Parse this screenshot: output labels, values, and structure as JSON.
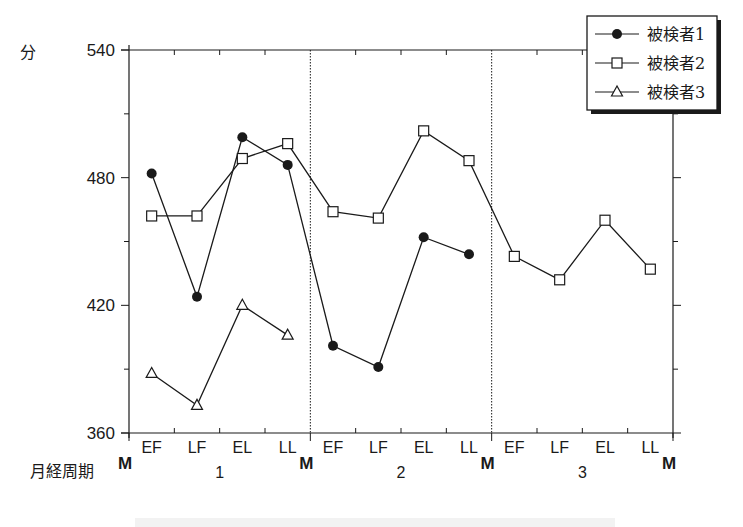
{
  "chart_data": {
    "type": "line",
    "title": "",
    "ylabel": "分",
    "xlabel": "月経周期",
    "ylim": [
      360,
      540
    ],
    "yticks": [
      360,
      420,
      480,
      540
    ],
    "y_minor_step": 30,
    "grid": false,
    "legend_position": "top-right",
    "cycles": [
      "1",
      "2",
      "3"
    ],
    "phases": [
      "EF",
      "LF",
      "EL",
      "LL"
    ],
    "boundary_label": "M",
    "categories": [
      "1-EF",
      "1-LF",
      "1-EL",
      "1-LL",
      "2-EF",
      "2-LF",
      "2-EL",
      "2-LL",
      "3-EF",
      "3-LF",
      "3-EL",
      "3-LL"
    ],
    "series": [
      {
        "name": "被検者1",
        "marker": "filled-circle",
        "values": [
          482,
          424,
          499,
          486,
          401,
          391,
          452,
          444,
          null,
          null,
          null,
          null
        ]
      },
      {
        "name": "被検者2",
        "marker": "open-square",
        "values": [
          462,
          462,
          489,
          496,
          464,
          461,
          502,
          488,
          443,
          432,
          460,
          437
        ]
      },
      {
        "name": "被検者3",
        "marker": "open-triangle",
        "values": [
          388,
          373,
          420,
          406,
          null,
          null,
          null,
          null,
          null,
          null,
          null,
          null
        ]
      }
    ]
  },
  "labels": {
    "y_unit": "分",
    "x_axis_title": "月経周期",
    "legend": [
      "被検者1",
      "被検者2",
      "被検者3"
    ]
  },
  "colors": {
    "ink": "#1a1a1a",
    "background": "#ffffff"
  }
}
